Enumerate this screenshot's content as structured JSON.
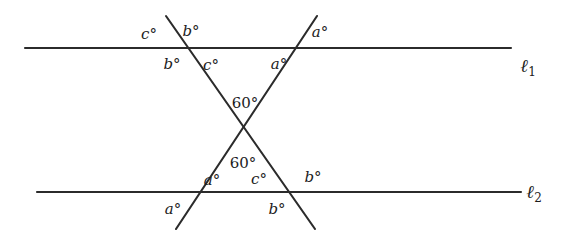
{
  "figure": {
    "type": "geometry-diagram",
    "background_color": "#ffffff",
    "stroke_color": "#2b2b2b",
    "text_color": "#1c1c1c",
    "width": 567,
    "height": 242
  },
  "lines": [
    {
      "name": "line-l1",
      "label": "ℓ",
      "subscript": "1",
      "x1": 25,
      "y1": 48,
      "x2": 511,
      "y2": 48,
      "label_x": 528,
      "label_y": 67
    },
    {
      "name": "line-l2",
      "label": "ℓ",
      "subscript": "2",
      "x1": 37,
      "y1": 192,
      "x2": 521,
      "y2": 192,
      "label_x": 534,
      "label_y": 193
    }
  ],
  "transversals": [
    {
      "name": "transversal-descending",
      "x1": 166,
      "y1": 16,
      "x2": 315,
      "y2": 229
    },
    {
      "name": "transversal-ascending",
      "x1": 317,
      "y1": 16,
      "x2": 176,
      "y2": 229
    }
  ],
  "intersections": {
    "upper_left": {
      "x": 178,
      "y": 48
    },
    "upper_right": {
      "x": 296,
      "y": 48
    },
    "lower_left": {
      "x": 197,
      "y": 192
    },
    "lower_right": {
      "x": 291,
      "y": 192
    },
    "center_x_crossing": {
      "x": 240,
      "y": 133
    }
  },
  "angle_labels": [
    {
      "id": "ul-above-left",
      "text": "c°",
      "x": 149,
      "y": 34,
      "numeric": false
    },
    {
      "id": "ul-above-right",
      "text": "b°",
      "x": 191,
      "y": 31,
      "numeric": false
    },
    {
      "id": "ul-below-left",
      "text": "b°",
      "x": 172,
      "y": 64,
      "numeric": false
    },
    {
      "id": "ul-below-right",
      "text": "c°",
      "x": 211,
      "y": 65,
      "numeric": false
    },
    {
      "id": "ur-above-right",
      "text": "a°",
      "x": 320,
      "y": 32,
      "numeric": false
    },
    {
      "id": "ur-below-left",
      "text": "a°",
      "x": 279,
      "y": 64,
      "numeric": false
    },
    {
      "id": "center-upper",
      "text": "60°",
      "x": 245,
      "y": 103,
      "numeric": true
    },
    {
      "id": "center-lower",
      "text": "60°",
      "x": 243,
      "y": 163,
      "numeric": true
    },
    {
      "id": "ll-above-right",
      "text": "a°",
      "x": 212,
      "y": 180,
      "numeric": false
    },
    {
      "id": "ll-below-left",
      "text": "a°",
      "x": 173,
      "y": 209,
      "numeric": false
    },
    {
      "id": "lr-above-left",
      "text": "c°",
      "x": 259,
      "y": 179,
      "numeric": false
    },
    {
      "id": "lr-above-right",
      "text": "b°",
      "x": 313,
      "y": 177,
      "numeric": false
    },
    {
      "id": "lr-below-left",
      "text": "b°",
      "x": 277,
      "y": 209,
      "numeric": false
    }
  ]
}
